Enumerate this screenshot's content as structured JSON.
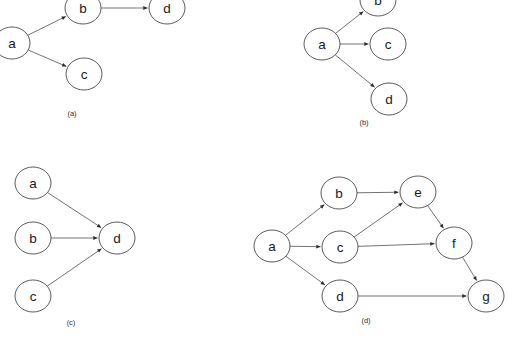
{
  "figure": {
    "background_color": "#ffffff",
    "node_stroke_color": "#4a4a4a",
    "edge_stroke_color": "#5a5a5a",
    "label_color": "#1a1a1a",
    "node_rx": 18,
    "node_ry": 16
  },
  "panels": [
    {
      "id": "panel-a",
      "caption": "(a)",
      "caption_x": 72,
      "caption_y": 113,
      "nodes": [
        {
          "label": "a",
          "x": 12,
          "y": 43
        },
        {
          "label": "b",
          "x": 83,
          "y": 8
        },
        {
          "label": "c",
          "x": 84,
          "y": 74
        },
        {
          "label": "d",
          "x": 167,
          "y": 8
        }
      ],
      "edges": [
        {
          "from": "a",
          "to": "b"
        },
        {
          "from": "a",
          "to": "c"
        },
        {
          "from": "b",
          "to": "d"
        }
      ]
    },
    {
      "id": "panel-b",
      "caption": "(b)",
      "caption_x": 364,
      "caption_y": 122,
      "nodes": [
        {
          "label": "a",
          "x": 322,
          "y": 44
        },
        {
          "label": "b",
          "x": 378,
          "y": 0
        },
        {
          "label": "c",
          "x": 388,
          "y": 44
        },
        {
          "label": "d",
          "x": 389,
          "y": 99
        }
      ],
      "edges": [
        {
          "from": "a",
          "to": "b"
        },
        {
          "from": "a",
          "to": "c"
        },
        {
          "from": "a",
          "to": "d"
        }
      ]
    },
    {
      "id": "panel-c",
      "caption": "(c)",
      "caption_x": 71,
      "caption_y": 322,
      "nodes": [
        {
          "label": "a",
          "x": 33,
          "y": 183
        },
        {
          "label": "b",
          "x": 33,
          "y": 238
        },
        {
          "label": "c",
          "x": 33,
          "y": 296
        },
        {
          "label": "d",
          "x": 117,
          "y": 238
        }
      ],
      "edges": [
        {
          "from": "a",
          "to": "d"
        },
        {
          "from": "b",
          "to": "d"
        },
        {
          "from": "c",
          "to": "d"
        }
      ]
    },
    {
      "id": "panel-d",
      "caption": "(d)",
      "caption_x": 366,
      "caption_y": 320,
      "nodes": [
        {
          "label": "a",
          "x": 272,
          "y": 246
        },
        {
          "label": "b",
          "x": 339,
          "y": 193
        },
        {
          "label": "c",
          "x": 340,
          "y": 247
        },
        {
          "label": "d",
          "x": 340,
          "y": 296
        },
        {
          "label": "e",
          "x": 418,
          "y": 192
        },
        {
          "label": "f",
          "x": 454,
          "y": 243
        },
        {
          "label": "g",
          "x": 486,
          "y": 296
        }
      ],
      "edges": [
        {
          "from": "a",
          "to": "b"
        },
        {
          "from": "a",
          "to": "c"
        },
        {
          "from": "a",
          "to": "d"
        },
        {
          "from": "b",
          "to": "e"
        },
        {
          "from": "c",
          "to": "e"
        },
        {
          "from": "c",
          "to": "f"
        },
        {
          "from": "e",
          "to": "f"
        },
        {
          "from": "d",
          "to": "g"
        },
        {
          "from": "f",
          "to": "g"
        }
      ]
    }
  ]
}
